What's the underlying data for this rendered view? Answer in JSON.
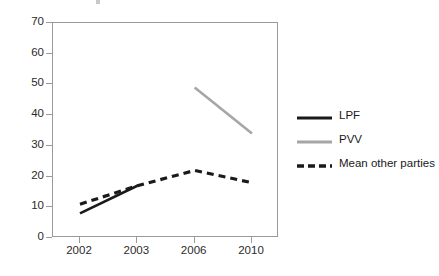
{
  "chart_data": {
    "type": "line",
    "title": "",
    "xlabel": "",
    "ylabel": "",
    "categories": [
      "2002",
      "2003",
      "2006",
      "2010"
    ],
    "ylim": [
      0,
      70
    ],
    "ytick_values": [
      0,
      10,
      20,
      30,
      40,
      50,
      60,
      70
    ],
    "ytick_labels": [
      "0",
      "10",
      "20",
      "30",
      "40",
      "50",
      "60",
      "70"
    ],
    "grid": false,
    "legend_position": "right",
    "series": [
      {
        "name": "LPF",
        "color": "#1a1a1a",
        "style": "solid",
        "values": [
          8,
          17,
          null,
          null
        ]
      },
      {
        "name": "PVV",
        "color": "#a6a6a6",
        "style": "solid",
        "values": [
          null,
          null,
          49,
          34
        ]
      },
      {
        "name": "Mean other parties",
        "color": "#1a1a1a",
        "style": "dashed",
        "values": [
          11,
          17,
          22,
          18
        ]
      }
    ]
  },
  "axes": {
    "y_labels": [
      "70",
      "60",
      "50",
      "40",
      "30",
      "20",
      "10",
      "0"
    ],
    "x_labels": [
      "2002",
      "2003",
      "2006",
      "2010"
    ]
  },
  "legend": {
    "items": [
      {
        "label": "LPF",
        "color": "#1a1a1a",
        "style": "solid"
      },
      {
        "label": "PVV",
        "color": "#a6a6a6",
        "style": "solid"
      },
      {
        "label": "Mean other parties",
        "color": "#1a1a1a",
        "style": "dashed"
      }
    ]
  },
  "colors": {
    "axis": "#9a9a9a",
    "text": "#2b2b2b",
    "lpf": "#1a1a1a",
    "pvv": "#a6a6a6",
    "mean_other": "#1a1a1a",
    "background": "#ffffff"
  }
}
